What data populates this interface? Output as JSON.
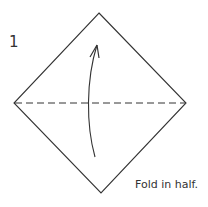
{
  "diagram": {
    "step_number": "1",
    "caption": "Fold in half.",
    "shape": "square-diamond",
    "fold_line": "valley-fold-horizontal-dashed",
    "arrow": "curved-up-fold-arrow",
    "colors": {
      "line": "#333333",
      "background": "#ffffff"
    }
  }
}
